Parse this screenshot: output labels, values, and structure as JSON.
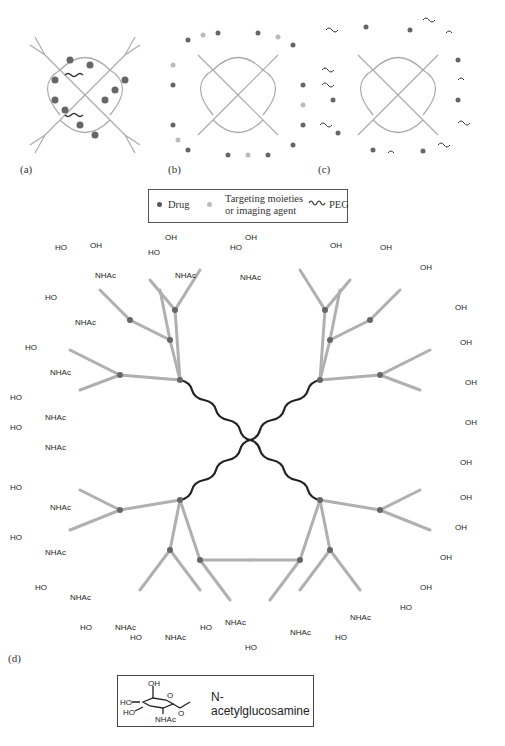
{
  "figure": {
    "panels": [
      {
        "id": "a",
        "label": "(a)",
        "description": "Dendrimer with drug encapsulated in interior cavities"
      },
      {
        "id": "b",
        "label": "(b)",
        "description": "Dendrimer with drug and targeting moieties conjugated at surface"
      },
      {
        "id": "c",
        "label": "(c)",
        "description": "Dendrimer with drug and PEG chains at surface"
      },
      {
        "id": "d",
        "label": "(d)",
        "description": "Dendrimer surface-functionalized with N-acetylglucosamine residues"
      }
    ],
    "legend": {
      "items": [
        {
          "symbol": "dark-dot",
          "label": "Drug",
          "color": "#555555"
        },
        {
          "symbol": "light-dot",
          "label_line1": "Targeting moieties",
          "label_line2": "or imaging agent",
          "color": "#bbbbbb"
        },
        {
          "symbol": "coil",
          "label": "PEG"
        }
      ]
    },
    "inset": {
      "label": "N-acetylglucosamine",
      "atoms": {
        "oh": "OH",
        "ho1": "HO",
        "ho2": "HO",
        "o_ring": "O",
        "nhac": "NHAc",
        "o_link": "O"
      }
    },
    "sugar_labels": {
      "ho": "HO",
      "oh": "OH",
      "nhac": "NHAc",
      "o": "O"
    },
    "colors": {
      "branch": "#b0b0b0",
      "node": "#666666",
      "core": "#222222",
      "drug": "#555555",
      "target": "#bdbdbd"
    }
  }
}
